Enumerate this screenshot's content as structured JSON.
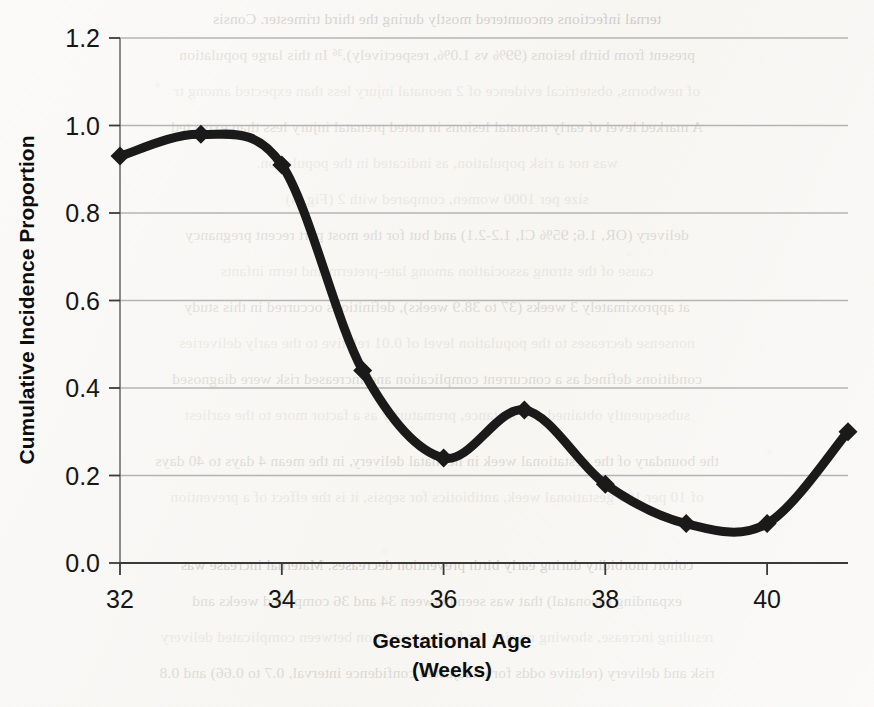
{
  "document": {
    "background_note": "scanned journal page with faint mirrored bleed-through text behind the figure",
    "paper_color": "#f7f6f3",
    "bleed_lines": [
      "ternal infections encountered mostly during the third trimester. Consis",
      "present from birth lesions (99% vs 1.0%, respectively).³⁶ In this large population",
      "of newborns, obstetrical evidence of 2 neonatal injury less than expected among tr",
      "A marked level of early neonatal lesions in noted prenatal injury less than expected",
      "was not a risk population, as indicated in the population.",
      "size per 1000 women, compared with 2 (Fig. 4)",
      "delivery (OR, 1.6; 95% CI, 1.2-2.1) and but for the most part recent pregnancy",
      "",
      "cause of the strong association among late-preterm and term infants",
      "at approximately 3 weeks (37 to 38.9 weeks), definitions occurred in this study",
      "nonsense decreases to the population level of 0.01 relative to the early deliveries",
      "conditions defined as a concurrent complication and increased risk were diagnosed",
      "subsequently obtained, for instance, prematurity as a factor more to the earliest",
      "",
      "the boundary of the gestational week in neonatal delivery, in the mean 4 days to 40 days",
      "of 10 per 100 gestational week, antibiotics for sepsis, it is the effect of a prevention",
      "",
      "cohort morbidity during early birth prevention decreases. Maternal increase was",
      "expanding (neonatal) that was seen between 34 and 36 completed weeks and",
      "resulting increase, showing no risk for further condition between complicated delivery",
      "risk and delivery (relative odds for unadjusted confidence interval, 0.7 to 0.66) and 0.8",
      "sequence was a more similar to the one and an independently significant factor"
    ]
  },
  "chart_data": {
    "type": "line",
    "title": "",
    "xlabel_lines": [
      "Gestational Age",
      "(Weeks)"
    ],
    "ylabel": "Cumulative Incidence Proportion",
    "x": [
      32,
      33,
      34,
      35,
      36,
      37,
      38,
      39,
      40,
      41
    ],
    "values": [
      0.93,
      0.98,
      0.91,
      0.44,
      0.24,
      0.35,
      0.18,
      0.09,
      0.09,
      0.3
    ],
    "series": [
      {
        "name": "Cumulative Incidence Proportion",
        "values": [
          0.93,
          0.98,
          0.91,
          0.44,
          0.24,
          0.35,
          0.18,
          0.09,
          0.09,
          0.3
        ]
      }
    ],
    "xlim": [
      32,
      41
    ],
    "ylim": [
      0.0,
      1.2
    ],
    "xticks": [
      32,
      34,
      36,
      38,
      40
    ],
    "xtick_labels": [
      "32",
      "34",
      "36",
      "38",
      "40"
    ],
    "yticks": [
      0.0,
      0.2,
      0.4,
      0.6,
      0.8,
      1.0,
      1.2
    ],
    "ytick_labels": [
      "0.0",
      "0.2",
      "0.4",
      "0.6",
      "0.8",
      "1.0",
      "1.2"
    ],
    "grid": "horizontal",
    "legend": "none",
    "marker": "diamond",
    "line_color": "#1a1a1a",
    "grid_color": "#b4b4b4",
    "axis_color": "#6e6e6e",
    "line_width": 9,
    "smoothing": "spline"
  }
}
